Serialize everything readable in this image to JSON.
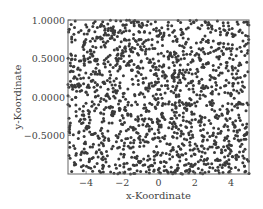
{
  "chart_data": {
    "type": "scatter",
    "title": "",
    "xlabel": "x-Koordinate",
    "ylabel": "y-Koordinate",
    "xlim": [
      -5,
      5
    ],
    "ylim": [
      -1,
      1
    ],
    "xticks": [
      -4,
      -2,
      0,
      2,
      4
    ],
    "xtick_labels": [
      "−4",
      "−2",
      "0",
      "2",
      "4"
    ],
    "yticks": [
      1.0,
      0.5,
      0.0,
      -0.5
    ],
    "ytick_labels": [
      "1.0000",
      "0.5000",
      "0.0000",
      "−0.5000"
    ],
    "grid": false,
    "legend": null,
    "marker_color": "#3a3a3a",
    "marker_size_px": 3,
    "series": [
      {
        "name": "points",
        "seed": 12345,
        "count": 1500
      }
    ]
  },
  "layout": {
    "plot_left": 68,
    "plot_top": 20,
    "plot_right": 249,
    "plot_bottom": 174
  }
}
